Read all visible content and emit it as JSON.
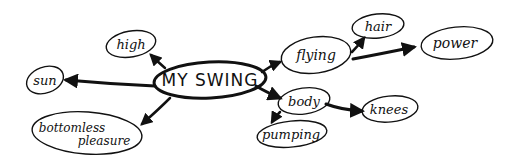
{
  "diagram": {
    "type": "mind-map",
    "center": {
      "label": "MY SWING"
    },
    "nodes": [
      {
        "id": "high",
        "label": "high",
        "parent": "center"
      },
      {
        "id": "sun",
        "label": "sun",
        "parent": "center"
      },
      {
        "id": "bottomless",
        "label_line1": "bottomless",
        "label_line2": "pleasure",
        "parent": "center"
      },
      {
        "id": "flying",
        "label": "flying",
        "parent": "center"
      },
      {
        "id": "hair",
        "label": "hair",
        "parent": "flying"
      },
      {
        "id": "power",
        "label": "power",
        "parent": "flying"
      },
      {
        "id": "body",
        "label": "body",
        "parent": "center"
      },
      {
        "id": "knees",
        "label": "knees",
        "parent": "body"
      },
      {
        "id": "pumping",
        "label": "pumping",
        "parent": "body"
      }
    ],
    "colors": {
      "ink": "#111111",
      "background": "#ffffff"
    }
  }
}
